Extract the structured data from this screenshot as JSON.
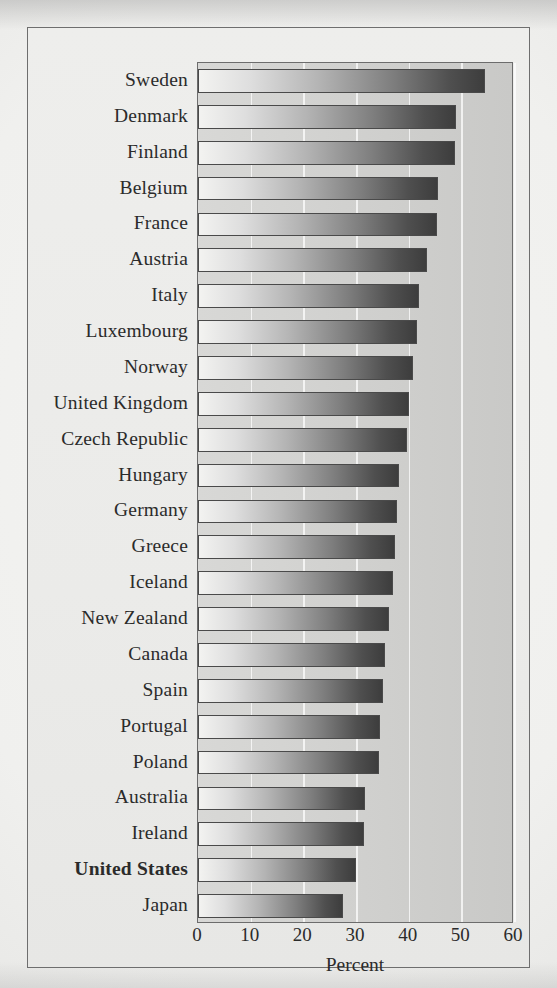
{
  "chart_data": {
    "type": "bar",
    "orientation": "horizontal",
    "title": "",
    "xlabel": "Percent",
    "ylabel": "",
    "xlim": [
      0,
      60
    ],
    "xticks": [
      0,
      10,
      20,
      30,
      40,
      50,
      60
    ],
    "grid": true,
    "legend": null,
    "highlighted_category": "United States",
    "categories": [
      "Sweden",
      "Denmark",
      "Finland",
      "Belgium",
      "France",
      "Austria",
      "Italy",
      "Luxembourg",
      "Norway",
      "United Kingdom",
      "Czech Republic",
      "Hungary",
      "Germany",
      "Greece",
      "Iceland",
      "New Zealand",
      "Canada",
      "Spain",
      "Portugal",
      "Poland",
      "Australia",
      "Ireland",
      "United States",
      "Japan"
    ],
    "values": [
      54.5,
      49.0,
      48.8,
      45.5,
      45.3,
      43.5,
      42.0,
      41.6,
      40.8,
      40.0,
      39.6,
      38.2,
      37.8,
      37.4,
      37.0,
      36.2,
      35.6,
      35.2,
      34.6,
      34.4,
      31.8,
      31.5,
      30.0,
      27.5
    ],
    "series": [
      {
        "name": "Percent",
        "values": [
          54.5,
          49.0,
          48.8,
          45.5,
          45.3,
          43.5,
          42.0,
          41.6,
          40.8,
          40.0,
          39.6,
          38.2,
          37.8,
          37.4,
          37.0,
          36.2,
          35.6,
          35.2,
          34.6,
          34.4,
          31.8,
          31.5,
          30.0,
          27.5
        ]
      }
    ]
  },
  "style": {
    "bar_fill_light": "#f3f3f1",
    "bar_fill_dark": "#3d3d3d",
    "bar_outline": "#4a4a4a",
    "plot_background": "#d2d2d0",
    "figure_background": "#ebebe9",
    "page_background": "#f0f0ee",
    "frame_border": "#6e6e6e",
    "gridline": "#ffffff",
    "text": "#2b2b2b"
  }
}
